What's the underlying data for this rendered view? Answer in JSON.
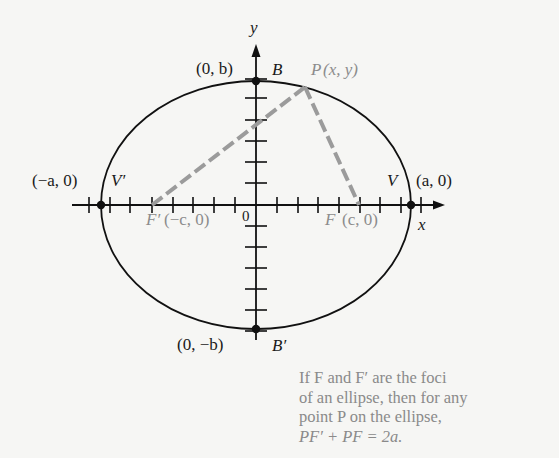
{
  "diagram": {
    "axes": {
      "x_label": "x",
      "y_label": "y",
      "origin_label": "0"
    },
    "points": {
      "B": {
        "name": "B",
        "coord": "(0, b)"
      },
      "B_prime": {
        "name": "B′",
        "coord": "(0, −b)"
      },
      "V": {
        "name": "V",
        "coord": "(a, 0)"
      },
      "V_prime": {
        "name": "V′",
        "coord": "(−a, 0)"
      },
      "F": {
        "name": "F",
        "coord": "(c, 0)"
      },
      "F_prime": {
        "name": "F′",
        "coord": "(−c, 0)"
      },
      "P": {
        "name": "P",
        "coord": "(x, y)"
      }
    },
    "colors": {
      "ink": "#111111",
      "dashed_segments": "#9b9b9b",
      "gray_text": "#8a8a8a",
      "background": "#f6f6f4"
    },
    "caption": {
      "line1": "If F and F′ are the foci",
      "line2": "of an ellipse, then for any",
      "line3": "point P on the ellipse,",
      "line4": "PF′ + PF = 2a."
    }
  }
}
